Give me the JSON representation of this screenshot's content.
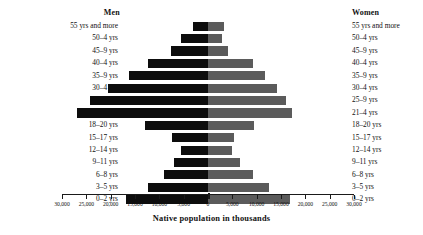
{
  "header": {
    "men_label": "Men",
    "women_label": "Women"
  },
  "axis": {
    "title": "Native population in thousands",
    "tick_labels_left": [
      "30,000",
      "25,000",
      "20,000",
      "15,000",
      "10,000",
      "5,000"
    ],
    "tick_label_center": "0",
    "tick_labels_right": [
      "5,000",
      "10,000",
      "15,000",
      "20,000",
      "25,000",
      "30,000"
    ]
  },
  "colors": {
    "men_bar": "#0d0d0d",
    "women_bar": "#5b5b5b",
    "axis": "#1a1a1a",
    "text": "#111111",
    "background": "#ffffff"
  },
  "chart_data": {
    "type": "bar",
    "subtype": "population-pyramid",
    "title": "",
    "xlabel": "Native population in thousands",
    "ylabel": "",
    "xlim": [
      -30000,
      30000
    ],
    "xticks": [
      -30000,
      -25000,
      -20000,
      -15000,
      -10000,
      -5000,
      0,
      5000,
      10000,
      15000,
      20000,
      25000,
      30000
    ],
    "grid": false,
    "legend": [
      "Men",
      "Women"
    ],
    "legend_position": "top-outside-left-and-right",
    "categories": [
      "55 yrs and more",
      "50–4 yrs",
      "45–9 yrs",
      "40–4 yrs",
      "35–9 yrs",
      "30–4 yrs",
      "25–9 yrs",
      "21–4 yrs",
      "18–20 yrs",
      "15–17 yrs",
      "12–14 yrs",
      "9–11 yrs",
      "6–8 yrs",
      "3–5 yrs",
      "0–2 yrs"
    ],
    "series": [
      {
        "name": "Men",
        "direction": "left",
        "values": [
          3100,
          5500,
          7600,
          12300,
          16300,
          20500,
          24300,
          26900,
          13000,
          7300,
          5500,
          7000,
          9000,
          12300,
          16800
        ]
      },
      {
        "name": "Women",
        "direction": "right",
        "values": [
          3300,
          2900,
          4100,
          9200,
          11700,
          14200,
          16100,
          17300,
          9400,
          5400,
          4900,
          6600,
          9300,
          12600,
          16900
        ]
      }
    ]
  }
}
